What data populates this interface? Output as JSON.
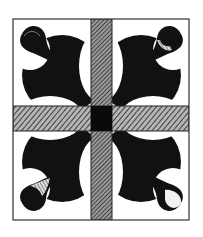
{
  "figure": {
    "colors": {
      "background": "#ffffff",
      "ink": "#111111",
      "hatch_light": "#8a8a8a",
      "hatch_dark": "#2a2a2a",
      "frame": "#333333"
    },
    "frame": {
      "x": 13,
      "y": 19,
      "w": 176,
      "h": 201
    },
    "vertical_band": {
      "x": 91,
      "w": 21
    },
    "horizontal_band": {
      "y": 106,
      "h": 25
    },
    "center_square": {
      "x": 91,
      "y": 106,
      "w": 21,
      "h": 25
    },
    "leaves": [
      "top-left",
      "top-right",
      "bottom-left",
      "bottom-right"
    ]
  }
}
